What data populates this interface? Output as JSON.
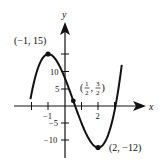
{
  "chart_data": {
    "type": "line",
    "title": "",
    "function": "f(x) = 2x^3 - 3x^2 - 12x + 8",
    "xlabel": "x",
    "ylabel": "y",
    "xlim": [
      -2.2,
      3.5
    ],
    "ylim": [
      -16,
      23
    ],
    "x_ticks": [
      -2,
      -1,
      1,
      2,
      3
    ],
    "x_tick_labels": [
      {
        "value": -1,
        "label": "−1"
      },
      {
        "value": 2,
        "label": "2"
      }
    ],
    "y_ticks": [
      -15,
      -10,
      -5,
      5,
      10,
      15
    ],
    "y_tick_labels": [
      {
        "value": 10,
        "label": "10"
      },
      {
        "value": 5,
        "label": "5"
      },
      {
        "value": -5,
        "label": "−5"
      },
      {
        "value": -10,
        "label": "−10"
      }
    ],
    "grid": false,
    "series": [
      {
        "name": "f(x)",
        "x": [
          -2.05,
          -1.5,
          -1,
          -0.5,
          0,
          0.5,
          1,
          1.5,
          2,
          2.5,
          3,
          3.4
        ],
        "y": [
          -16.5,
          9.5,
          15,
          12.5,
          8,
          1.5,
          -5,
          -10,
          -12,
          -9.5,
          -1,
          11.9
        ]
      }
    ],
    "annotations": [
      {
        "point": [
          -1,
          15
        ],
        "label": "(−1, 15)",
        "kind": "local maximum"
      },
      {
        "point": [
          0.5,
          1.5
        ],
        "label": "(1/2, 3/2)",
        "kind": "inflection point"
      },
      {
        "point": [
          2,
          -12
        ],
        "label": "(2, −12)",
        "kind": "local minimum"
      }
    ]
  },
  "labels": {
    "x_axis": "x",
    "y_axis": "y",
    "max_point": "(−1, 15)",
    "min_point": "(2, −12)",
    "inflection_num_x": "1",
    "inflection_den_x": "2",
    "inflection_num_y": "3",
    "inflection_den_y": "2",
    "tick_x_neg1": "−1",
    "tick_x_2": "2",
    "tick_y_10": "10",
    "tick_y_5": "5",
    "tick_y_neg5": "−5",
    "tick_y_neg10": "−10"
  }
}
